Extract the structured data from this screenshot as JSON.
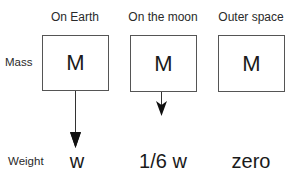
{
  "columns": [
    {
      "title": "On Earth",
      "mass": "M",
      "weight": "w",
      "arrow_length": "long"
    },
    {
      "title": "On the moon",
      "mass": "M",
      "weight": "1/6 w",
      "arrow_length": "short"
    },
    {
      "title": "Outer space",
      "mass": "M",
      "weight": "zero",
      "arrow_length": "none"
    }
  ],
  "rows": {
    "mass_label": "Mass",
    "weight_label": "Weight"
  },
  "colors": {
    "line": "#333333",
    "box_border": "#555555",
    "text": "#1a1a1a"
  }
}
